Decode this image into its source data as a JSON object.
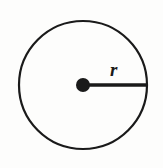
{
  "figure": {
    "name": "circle-with-radius",
    "background_color": "#fdfdfc",
    "ink_color": "#1a1a1a",
    "labels": {
      "radius": "r"
    },
    "geometry": {
      "circle": {
        "center_x": 83,
        "center_y": 85,
        "radius": 64,
        "stroke_width": 2.2
      },
      "center_dot": {
        "center_x": 83,
        "center_y": 85,
        "radius": 7
      },
      "radius_segment": {
        "x1": 83,
        "y1": 85,
        "x2": 147,
        "y2": 85,
        "stroke_width": 3.4
      },
      "radius_label_position": {
        "x": 110,
        "y": 76
      }
    }
  },
  "chart_data": {
    "type": "diagram",
    "title": "",
    "shapes": [
      {
        "shape": "circle",
        "role": "outline",
        "center": [
          83,
          85
        ],
        "radius": 64,
        "filled": false,
        "stroke_width": 2.2,
        "stroke_color": "#1a1a1a"
      },
      {
        "shape": "point",
        "role": "center-marker",
        "center": [
          83,
          85
        ],
        "radius": 7,
        "filled": true,
        "fill_color": "#1a1a1a"
      },
      {
        "shape": "segment",
        "role": "radius",
        "from": [
          83,
          85
        ],
        "to": [
          147,
          85
        ],
        "length": 64,
        "stroke_width": 3.4,
        "stroke_color": "#1a1a1a",
        "label": "r"
      }
    ],
    "annotations": [
      {
        "text": "r",
        "position": [
          110,
          76
        ],
        "style": "italic-serif",
        "refers_to": "radius"
      }
    ],
    "grid": false,
    "legend": null,
    "axes": null
  }
}
